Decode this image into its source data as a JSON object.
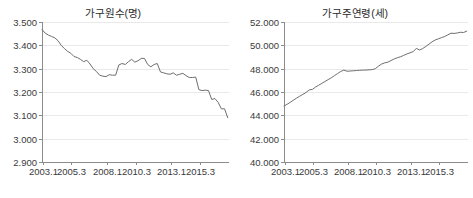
{
  "figure": {
    "background": "#ffffff",
    "line_color": "#6e6e6e",
    "grid_color": "#e9e9e9",
    "axis_color": "#8c8c8c"
  },
  "chart_data": [
    {
      "type": "line",
      "id": "household-size",
      "title": "가구원수(명)",
      "xlabel": "",
      "ylabel": "",
      "ylim": [
        2.9,
        3.5
      ],
      "yticks": [
        2.9,
        3.0,
        3.1,
        3.2,
        3.3,
        3.4,
        3.5
      ],
      "ytick_labels": [
        "2.900",
        "3.000",
        "3.100",
        "3.200",
        "3.300",
        "3.400",
        "3.500"
      ],
      "xlim": [
        2003.0,
        2017.6
      ],
      "xticks": [
        2003.1,
        2005.3,
        2008.1,
        2010.3,
        2013.1,
        2015.3
      ],
      "xtick_labels": [
        "2003.1",
        "2005.3",
        "2008.1",
        "2010.3",
        "2013.1",
        "2015.3"
      ],
      "grid": true,
      "legend": "none",
      "x": [
        2003.0,
        2003.25,
        2003.5,
        2003.75,
        2004.0,
        2004.25,
        2004.5,
        2004.75,
        2005.0,
        2005.25,
        2005.5,
        2005.75,
        2006.0,
        2006.25,
        2006.5,
        2006.75,
        2007.0,
        2007.25,
        2007.5,
        2007.75,
        2008.0,
        2008.25,
        2008.5,
        2008.75,
        2009.0,
        2009.25,
        2009.5,
        2009.75,
        2010.0,
        2010.25,
        2010.5,
        2010.75,
        2011.0,
        2011.25,
        2011.5,
        2011.75,
        2012.0,
        2012.25,
        2012.5,
        2012.75,
        2013.0,
        2013.25,
        2013.5,
        2013.75,
        2014.0,
        2014.25,
        2014.5,
        2014.75,
        2015.0,
        2015.25,
        2015.5,
        2015.75,
        2016.0,
        2016.25,
        2016.5,
        2016.75,
        2017.0,
        2017.25,
        2017.5
      ],
      "values": [
        3.468,
        3.452,
        3.444,
        3.438,
        3.432,
        3.42,
        3.4,
        3.386,
        3.374,
        3.366,
        3.352,
        3.348,
        3.34,
        3.33,
        3.336,
        3.32,
        3.3,
        3.288,
        3.272,
        3.268,
        3.266,
        3.274,
        3.272,
        3.272,
        3.316,
        3.322,
        3.318,
        3.33,
        3.34,
        3.328,
        3.334,
        3.344,
        3.344,
        3.318,
        3.308,
        3.318,
        3.322,
        3.286,
        3.282,
        3.278,
        3.276,
        3.282,
        3.272,
        3.276,
        3.28,
        3.27,
        3.262,
        3.262,
        3.264,
        3.21,
        3.206,
        3.208,
        3.206,
        3.168,
        3.172,
        3.156,
        3.128,
        3.128,
        3.09
      ]
    },
    {
      "type": "line",
      "id": "householder-age",
      "title": "가구주연령(세)",
      "xlabel": "",
      "ylabel": "",
      "ylim": [
        40.0,
        52.0
      ],
      "yticks": [
        40.0,
        42.0,
        44.0,
        46.0,
        48.0,
        50.0,
        52.0
      ],
      "ytick_labels": [
        "40.000",
        "42.000",
        "44.000",
        "46.000",
        "48.000",
        "50.000",
        "52.000"
      ],
      "xlim": [
        2003.0,
        2017.6
      ],
      "xticks": [
        2003.1,
        2005.3,
        2008.1,
        2010.3,
        2013.1,
        2015.3
      ],
      "xtick_labels": [
        "2003.1",
        "2005.3",
        "2008.1",
        "2010.3",
        "2013.1",
        "2015.3"
      ],
      "grid": true,
      "legend": "none",
      "x": [
        2003.0,
        2003.25,
        2003.5,
        2003.75,
        2004.0,
        2004.25,
        2004.5,
        2004.75,
        2005.0,
        2005.25,
        2005.5,
        2005.75,
        2006.0,
        2006.25,
        2006.5,
        2006.75,
        2007.0,
        2007.25,
        2007.5,
        2007.75,
        2008.0,
        2008.25,
        2008.5,
        2008.75,
        2009.0,
        2009.25,
        2009.5,
        2009.75,
        2010.0,
        2010.25,
        2010.5,
        2010.75,
        2011.0,
        2011.25,
        2011.5,
        2011.75,
        2012.0,
        2012.25,
        2012.5,
        2012.75,
        2013.0,
        2013.25,
        2013.5,
        2013.75,
        2014.0,
        2014.25,
        2014.5,
        2014.75,
        2015.0,
        2015.25,
        2015.5,
        2015.75,
        2016.0,
        2016.25,
        2016.5,
        2016.75,
        2017.0,
        2017.25,
        2017.5
      ],
      "values": [
        44.8,
        44.95,
        45.12,
        45.3,
        45.48,
        45.64,
        45.8,
        45.96,
        46.18,
        46.22,
        46.42,
        46.58,
        46.74,
        46.9,
        47.06,
        47.22,
        47.4,
        47.58,
        47.76,
        47.88,
        47.78,
        47.8,
        47.82,
        47.84,
        47.86,
        47.88,
        47.88,
        47.9,
        47.92,
        48.0,
        48.22,
        48.4,
        48.5,
        48.56,
        48.7,
        48.84,
        48.94,
        49.02,
        49.14,
        49.26,
        49.36,
        49.46,
        49.74,
        49.6,
        49.72,
        49.9,
        50.1,
        50.3,
        50.46,
        50.56,
        50.66,
        50.76,
        50.9,
        51.04,
        51.02,
        51.06,
        51.12,
        51.1,
        51.22
      ]
    }
  ]
}
